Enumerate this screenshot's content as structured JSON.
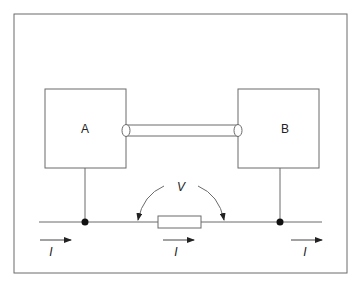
{
  "diagram": {
    "box_a": {
      "label": "A"
    },
    "box_b": {
      "label": "B"
    },
    "voltage": {
      "label": "V"
    },
    "currents": [
      {
        "label": "I",
        "position": "left"
      },
      {
        "label": "I",
        "position": "center"
      },
      {
        "label": "I",
        "position": "right"
      }
    ],
    "colors": {
      "line": "#6b6b6b",
      "dot": "#111111",
      "text": "#222222"
    }
  }
}
